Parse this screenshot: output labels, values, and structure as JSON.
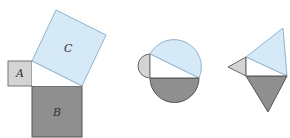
{
  "figures": [
    {
      "name": "squares",
      "labels": {
        "A": "A",
        "B": "B",
        "C": "C"
      }
    },
    {
      "name": "semicircles"
    },
    {
      "name": "triangles"
    }
  ],
  "colors": {
    "light_blue_fill": "#d6e9f7",
    "light_blue_stroke": "#8fb3d1",
    "light_gray_fill": "#d4d4d4",
    "dark_gray_fill": "#8f8f8f",
    "stroke": "#555555",
    "background": "#ffffff"
  }
}
